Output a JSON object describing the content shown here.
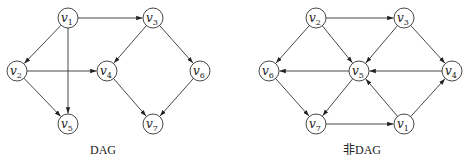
{
  "graphs": [
    {
      "id": "dag",
      "caption": "DAG",
      "nodes": [
        {
          "id": "v1",
          "label": "v",
          "sub": "1"
        },
        {
          "id": "v2",
          "label": "v",
          "sub": "2"
        },
        {
          "id": "v3",
          "label": "v",
          "sub": "3"
        },
        {
          "id": "v4",
          "label": "v",
          "sub": "4"
        },
        {
          "id": "v5",
          "label": "v",
          "sub": "5"
        },
        {
          "id": "v6",
          "label": "v",
          "sub": "6"
        },
        {
          "id": "v7",
          "label": "v",
          "sub": "7"
        }
      ],
      "edges": [
        {
          "from": "v1",
          "to": "v3"
        },
        {
          "from": "v1",
          "to": "v2"
        },
        {
          "from": "v1",
          "to": "v5"
        },
        {
          "from": "v2",
          "to": "v4"
        },
        {
          "from": "v2",
          "to": "v5"
        },
        {
          "from": "v3",
          "to": "v4"
        },
        {
          "from": "v3",
          "to": "v6"
        },
        {
          "from": "v4",
          "to": "v7"
        },
        {
          "from": "v6",
          "to": "v7"
        }
      ]
    },
    {
      "id": "non-dag",
      "caption": "非DAG",
      "nodes": [
        {
          "id": "v1",
          "label": "v",
          "sub": "1"
        },
        {
          "id": "v2",
          "label": "v",
          "sub": "2"
        },
        {
          "id": "v3",
          "label": "v",
          "sub": "3"
        },
        {
          "id": "v4",
          "label": "v",
          "sub": "4"
        },
        {
          "id": "v5",
          "label": "v",
          "sub": "5"
        },
        {
          "id": "v6",
          "label": "v",
          "sub": "6"
        },
        {
          "id": "v7",
          "label": "v",
          "sub": "7"
        }
      ],
      "edges": [
        {
          "from": "v2",
          "to": "v3"
        },
        {
          "from": "v2",
          "to": "v6"
        },
        {
          "from": "v2",
          "to": "v5"
        },
        {
          "from": "v3",
          "to": "v5"
        },
        {
          "from": "v3",
          "to": "v4"
        },
        {
          "from": "v4",
          "to": "v5"
        },
        {
          "from": "v5",
          "to": "v6"
        },
        {
          "from": "v5",
          "to": "v7"
        },
        {
          "from": "v6",
          "to": "v7"
        },
        {
          "from": "v7",
          "to": "v1"
        },
        {
          "from": "v1",
          "to": "v5"
        },
        {
          "from": "v1",
          "to": "v4"
        }
      ]
    }
  ]
}
